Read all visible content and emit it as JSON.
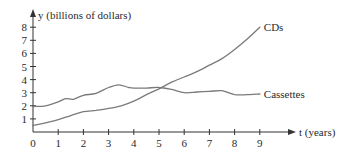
{
  "chart_data": {
    "type": "line",
    "title": "",
    "xlabel": "t (years)",
    "ylabel": "y (billions of dollars)",
    "xlim": [
      0,
      9
    ],
    "ylim": [
      0,
      8
    ],
    "x_ticks": [
      "0",
      "1",
      "2",
      "3",
      "4",
      "5",
      "6",
      "7",
      "8",
      "9"
    ],
    "y_ticks": [
      "1",
      "2",
      "3",
      "4",
      "5",
      "6",
      "7",
      "8"
    ],
    "grid": false,
    "legend": "inline-right",
    "series": [
      {
        "name": "CDs",
        "x": [
          0,
          0.5,
          1,
          1.5,
          2,
          2.5,
          3,
          3.5,
          4,
          4.5,
          5,
          5.5,
          6,
          6.5,
          7,
          7.5,
          8,
          8.5,
          9
        ],
        "values": [
          0.5,
          0.7,
          0.95,
          1.25,
          1.55,
          1.65,
          1.8,
          2.0,
          2.35,
          2.85,
          3.3,
          3.8,
          4.2,
          4.6,
          5.1,
          5.6,
          6.3,
          7.1,
          8.0
        ]
      },
      {
        "name": "Cassettes",
        "x": [
          0,
          0.5,
          1,
          1.3,
          1.6,
          2,
          2.5,
          3,
          3.4,
          3.8,
          4,
          4.5,
          5,
          5.5,
          6,
          6.5,
          7,
          7.5,
          8,
          8.5,
          9
        ],
        "values": [
          1.95,
          2.0,
          2.3,
          2.55,
          2.5,
          2.8,
          2.95,
          3.4,
          3.6,
          3.4,
          3.35,
          3.35,
          3.4,
          3.25,
          3.0,
          3.05,
          3.1,
          3.15,
          2.85,
          2.85,
          2.9
        ]
      }
    ]
  }
}
